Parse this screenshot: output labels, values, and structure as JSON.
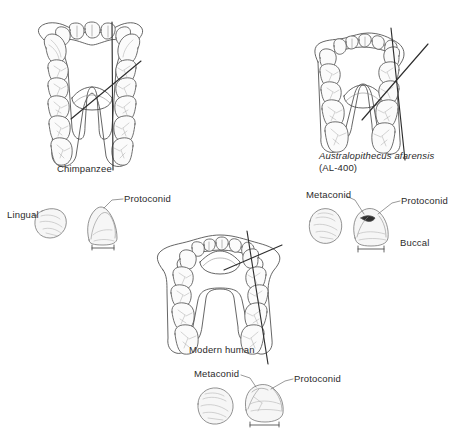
{
  "figure": {
    "title_visible": false,
    "background_color": "#ffffff",
    "ink_color": "#4a4a4a",
    "axis_line_color": "#2e2e2e"
  },
  "panels": {
    "chimpanzee": {
      "label": "Chimpanzee",
      "arcade_shape": "U-shaped with parallel postcanine tooth rows"
    },
    "afarensis": {
      "label_line1": "Australopithecus afarensis",
      "label_line2": "(AL-400)",
      "arcade_shape": "intermediate V/U-shaped arcade"
    },
    "modern_human": {
      "label": "Modern human",
      "arcade_shape": "parabolic arcade"
    }
  },
  "tooth_details": {
    "chimpanzee_tooth": {
      "left_label": "Lingual",
      "cusp_label": "Protoconid"
    },
    "afarensis_tooth": {
      "cusp_label_left": "Metaconid",
      "cusp_label_right": "Protoconid",
      "side_label": "Buccal"
    },
    "human_tooth": {
      "cusp_label_left": "Metaconid",
      "cusp_label_right": "Protoconid"
    }
  }
}
